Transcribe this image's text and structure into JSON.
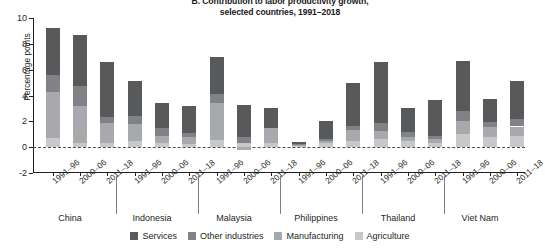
{
  "title": {
    "line1": "B. Contribution to labor productivity growth,",
    "line2": "selected countries, 1991–2018"
  },
  "axes": {
    "ylabel": "Percentage points",
    "yticks": [
      10,
      8,
      6,
      4,
      2,
      0,
      -2
    ],
    "ytick_labels": [
      "10",
      "8",
      "6",
      "4",
      "2",
      "0",
      "-2"
    ],
    "ylim": [
      -2,
      10
    ]
  },
  "legend": {
    "position": "bottom-center",
    "items": [
      {
        "label": "Services",
        "color": "#58595b"
      },
      {
        "label": "Other industries",
        "color": "#808285"
      },
      {
        "label": "Manufacturing",
        "color": "#a7a9ac"
      },
      {
        "label": "Agriculture",
        "color": "#c7c8ca"
      }
    ]
  },
  "countries": [
    "China",
    "Indonesia",
    "Malaysia",
    "Philippines",
    "Thailand",
    "Viet Nam"
  ],
  "periods": [
    "1991–96",
    "2000–06",
    "2011–18"
  ],
  "chart_data": {
    "type": "bar",
    "subtype": "stacked-vertical-grouped",
    "title": "B. Contribution to labor productivity growth, selected countries, 1991–2018",
    "xlabel": "",
    "ylabel": "Percentage points",
    "ylim": [
      -2,
      10
    ],
    "yticks": [
      -2,
      0,
      2,
      4,
      6,
      8,
      10
    ],
    "grid": false,
    "zero_line": true,
    "legend_position": "bottom-center",
    "group_labels": [
      "China",
      "Indonesia",
      "Malaysia",
      "Philippines",
      "Thailand",
      "Viet Nam"
    ],
    "categories": [
      "China 1991–96",
      "China 2000–06",
      "China 2011–18",
      "Indonesia 1991–96",
      "Indonesia 2000–06",
      "Indonesia 2011–18",
      "Malaysia 1991–96",
      "Malaysia 2000–06",
      "Malaysia 2011–18",
      "Philippines 1991–96",
      "Philippines 2000–06",
      "Philippines 2011–18",
      "Thailand 1991–96",
      "Thailand 2000–06",
      "Thailand 2011–18",
      "Viet Nam 1991–96",
      "Viet Nam 2000–06",
      "Viet Nam 2011–18"
    ],
    "series": [
      {
        "name": "Agriculture",
        "color": "#c7c8ca",
        "values": [
          0.7,
          0.35,
          0.35,
          0.5,
          0.3,
          0.25,
          0.55,
          0.35,
          0.3,
          0.1,
          0.3,
          0.45,
          0.65,
          0.45,
          0.35,
          1.0,
          0.8,
          0.85
        ]
      },
      {
        "name": "Manufacturing",
        "color": "#a7a9ac",
        "values": [
          3.6,
          2.85,
          1.55,
          1.3,
          0.6,
          0.55,
          2.85,
          -0.25,
          1.15,
          0.1,
          0.15,
          0.85,
          0.6,
          0.35,
          0.3,
          1.05,
          0.75,
          0.75
        ]
      },
      {
        "name": "Other industries",
        "color": "#808285",
        "values": [
          1.3,
          1.5,
          0.4,
          0.6,
          0.55,
          0.3,
          0.75,
          0.4,
          0.0,
          0.05,
          0.2,
          0.35,
          0.6,
          0.35,
          0.25,
          0.75,
          0.4,
          0.55
        ]
      },
      {
        "name": "Services",
        "color": "#58595b",
        "values": [
          3.6,
          4.0,
          4.3,
          2.7,
          1.95,
          2.1,
          2.85,
          2.5,
          1.6,
          0.15,
          1.35,
          3.35,
          4.75,
          1.85,
          2.75,
          3.9,
          1.75,
          2.95
        ]
      }
    ],
    "totals": [
      9.2,
      8.7,
      6.6,
      5.1,
      3.4,
      3.2,
      7.0,
      3.0,
      3.05,
      0.4,
      2.0,
      5.0,
      6.6,
      3.0,
      3.65,
      6.7,
      3.7,
      5.1
    ]
  }
}
